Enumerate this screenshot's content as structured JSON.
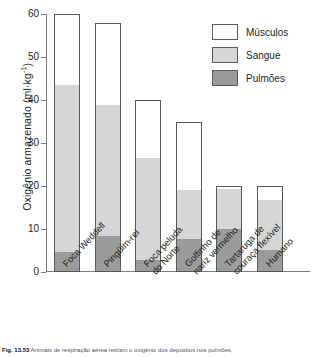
{
  "chart_data": {
    "type": "bar",
    "subtype": "stacked-vertical",
    "title": "",
    "xlabel": "",
    "ylabel": "Oxigênio armazenado (ml·kg",
    "ylabel_exponent": "-1",
    "ylabel_suffix": ")",
    "ylim": [
      0,
      60
    ],
    "yticks": [
      0,
      10,
      20,
      30,
      40,
      50,
      60
    ],
    "ytick_labels": [
      "0",
      "10",
      "20",
      "30",
      "40",
      "50",
      "60"
    ],
    "grid": false,
    "legend_position": "top-right",
    "units": "ml·kg^-1",
    "categories": [
      "Foca Weddell",
      "Pingüim-rei",
      "Foca peluda do Norte",
      "Golfinho de nariz vermelho",
      "Tartaruga de couraça flexível",
      "Humano"
    ],
    "category_lines": [
      [
        "Foca Weddell"
      ],
      [
        "Pingüim-rei"
      ],
      [
        "Foca peluda",
        "do Norte"
      ],
      [
        "Golfinho de",
        "nariz vermelho"
      ],
      [
        "Tartaruga de",
        "couraça flexível"
      ],
      [
        "Humano"
      ]
    ],
    "series": [
      {
        "name": "Pulmões",
        "color": "#9b9b9b",
        "values": [
          4.5,
          8.3,
          2.5,
          7.5,
          10.0,
          5.0
        ]
      },
      {
        "name": "Sangue",
        "color": "#d6d6d6",
        "values": [
          39.0,
          30.7,
          24.0,
          11.5,
          9.5,
          12.0
        ]
      },
      {
        "name": "Músculos",
        "color": "#ffffff",
        "values": [
          16.5,
          19.0,
          13.5,
          16.0,
          0.5,
          3.0
        ]
      }
    ],
    "totals": [
      60,
      58,
      40,
      35,
      20,
      20
    ],
    "stack_order_bottom_to_top": [
      "Pulmões",
      "Sangue",
      "Músculos"
    ]
  },
  "legend": {
    "items": [
      {
        "label": "Músculos",
        "swatch": "musculos"
      },
      {
        "label": "Sangue",
        "swatch": "sangue"
      },
      {
        "label": "Pulmões",
        "swatch": "pulmoes"
      }
    ]
  },
  "caption": {
    "number": "Fig. 13.53",
    "text": "Animais de respiração aérea retiram o oxigênio dos depósitos nos pulmões,"
  }
}
